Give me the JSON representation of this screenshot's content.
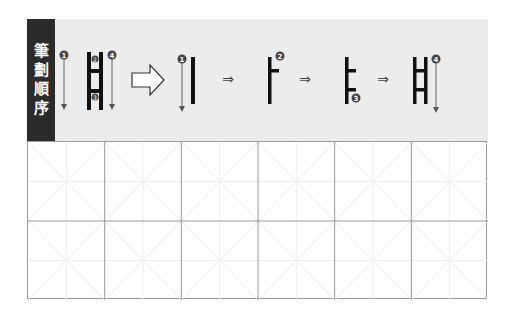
{
  "label": {
    "chars": [
      "筆",
      "劃",
      "順",
      "序"
    ]
  },
  "stroke_order": {
    "overview": {
      "numbers": [
        "1",
        "2",
        "3",
        "4"
      ]
    },
    "steps": [
      {
        "step": 1,
        "number": "1"
      },
      {
        "step": 2,
        "number": "2"
      },
      {
        "step": 3,
        "number": "3"
      },
      {
        "step": 4,
        "number": "4"
      }
    ],
    "small_arrow": "⇒"
  },
  "grid": {
    "columns": 6,
    "rows": 2
  },
  "colors": {
    "label_bg": "#2b2b2b",
    "header_bg": "#ececec",
    "grid_line": "#999999",
    "guide_line": "#e6e6e6"
  }
}
